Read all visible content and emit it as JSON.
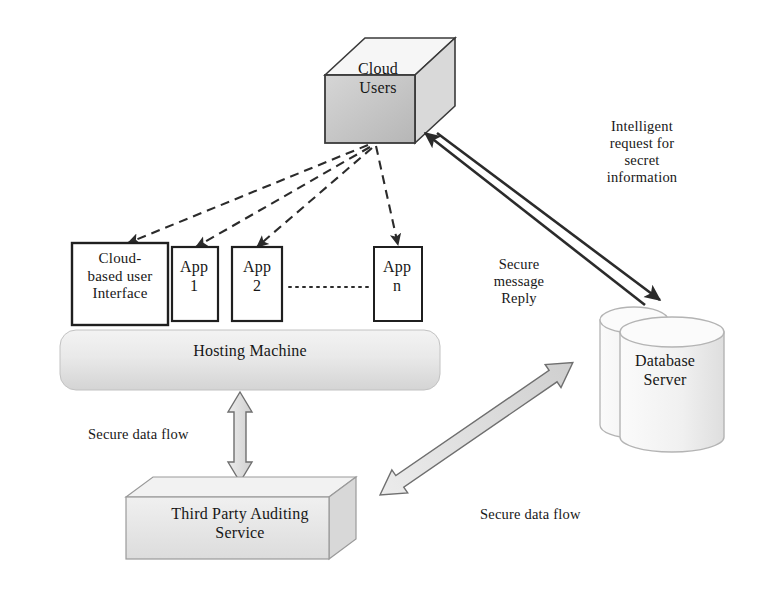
{
  "diagram": {
    "nodes": {
      "cloud_users": {
        "label": "Cloud\nUsers",
        "shape": "cube",
        "fill": "#c9c9c9"
      },
      "cloud_ui": {
        "label": "Cloud-\nbased user\nInterface",
        "shape": "rectangle",
        "fill": "#ffffff"
      },
      "app1": {
        "label": "App\n1",
        "shape": "rectangle",
        "fill": "#ffffff"
      },
      "app2": {
        "label": "App\n2",
        "shape": "rectangle",
        "fill": "#ffffff"
      },
      "appn": {
        "label": "App\nn",
        "shape": "rectangle",
        "fill": "#ffffff"
      },
      "hosting_machine": {
        "label": "Hosting Machine",
        "shape": "rounded-bar",
        "fill": "#e6e6e6"
      },
      "database_server": {
        "label": "Database\nServer",
        "shape": "double-cylinder",
        "fill": "#f2f2f2"
      },
      "third_party_auditing": {
        "label": "Third Party Auditing\nService",
        "shape": "cube-3d",
        "fill": "#e8e8e8"
      }
    },
    "edges": {
      "users_to_apps": {
        "style": "dashed",
        "label": "",
        "count": 4
      },
      "users_db_request": {
        "style": "solid-double",
        "label": "Intelligent\nrequest for\nsecret\ninformation"
      },
      "db_users_reply": {
        "style": "solid-double",
        "label": "Secure\nmessage\nReply"
      },
      "hosting_to_tpa": {
        "style": "block-arrow-vertical",
        "label": "Secure data flow"
      },
      "tpa_to_db": {
        "style": "block-arrow-diagonal",
        "label": "Secure data flow"
      },
      "app_chain": {
        "style": "dotted",
        "label": ""
      }
    },
    "colors": {
      "stroke": "#2b2b2b",
      "cube_fill": "#c9c9c9",
      "cube_top": "#f4f4f4",
      "cube_side": "#d8d8d8",
      "bar_fill": "#e6e6e6",
      "cylinder_fill": "#f4f4f4",
      "block_arrow_fill": "#dcdcdc",
      "background": "#ffffff"
    }
  }
}
